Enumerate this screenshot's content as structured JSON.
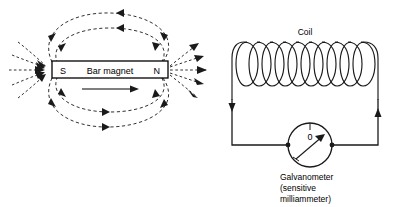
{
  "figure": {
    "background_color": "#ffffff",
    "ink_color": "#1a1a1a"
  },
  "magnet_panel": {
    "box": {
      "south_pole_label": "S",
      "north_pole_label": "N",
      "body_label": "Bar magnet"
    },
    "motion_arrow": {
      "name": "motion-arrow",
      "direction": "right",
      "meaning": "magnet moves toward the coil"
    },
    "field": {
      "style": "dashed",
      "line_count": 8,
      "arrow_convention": "field lines emerge from N and return to S"
    }
  },
  "circuit_panel": {
    "coil_label": "Coil",
    "coil_turns": 10,
    "galvanometer": {
      "dial_zero_label": "0",
      "needle_deflection": "deflected clockwise from zero",
      "caption_lines": [
        "Galvanometer",
        "(sensitive",
        "milliammeter)"
      ]
    },
    "current_arrows": {
      "left_wire_direction": "down",
      "right_wire_direction": "up"
    }
  }
}
